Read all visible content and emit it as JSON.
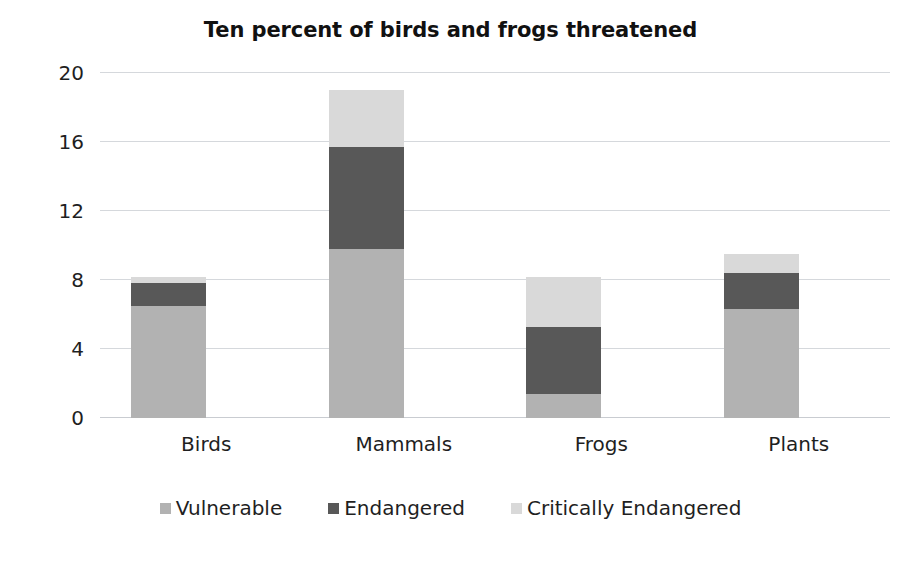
{
  "chart_data": {
    "type": "bar",
    "subtype": "stacked-bar",
    "title": "Ten percent of birds and frogs threatened",
    "xlabel": "",
    "ylabel": "",
    "categories": [
      "Birds",
      "Mammals",
      "Frogs",
      "Plants"
    ],
    "series": [
      {
        "name": "Vulnerable",
        "color": "#b2b2b2",
        "values": [
          6.5,
          9.8,
          1.4,
          6.3
        ]
      },
      {
        "name": "Endangered",
        "color": "#585858",
        "values": [
          1.3,
          5.9,
          3.9,
          2.1
        ]
      },
      {
        "name": "Critically Endangered",
        "color": "#d9d9d9",
        "values": [
          0.4,
          3.3,
          2.9,
          1.1
        ]
      }
    ],
    "totals": [
      8.2,
      19.0,
      8.2,
      9.5
    ],
    "ylim": [
      0,
      20
    ],
    "yticks": [
      0,
      4,
      8,
      12,
      16,
      20
    ],
    "ytick_labels": [
      "0",
      "4",
      "8",
      "12",
      "16",
      "20"
    ],
    "grid": true,
    "grid_axis": "y",
    "legend_position": "bottom",
    "legend": [
      "Vulnerable",
      "Endangered",
      "Critically Endangered"
    ],
    "stack_order_bottom_to_top": [
      "Vulnerable",
      "Endangered",
      "Critically Endangered"
    ],
    "background_color": "#ffffff",
    "gridline_color": "#d5d8dc",
    "text_color": "#1f1f1f"
  }
}
